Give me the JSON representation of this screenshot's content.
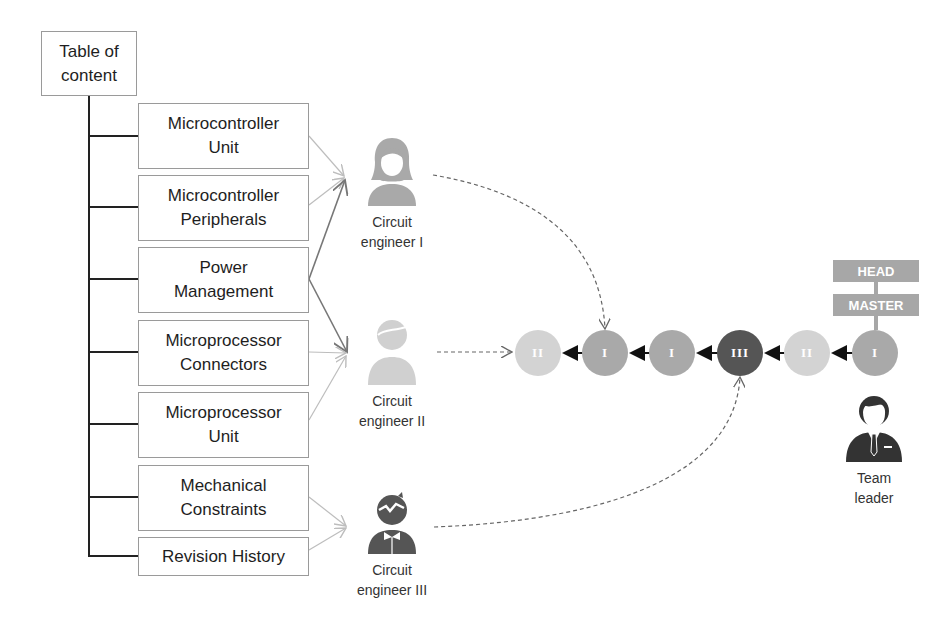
{
  "toc": {
    "root_label_line1": "Table of",
    "root_label_line2": "content",
    "sections": [
      {
        "line1": "Microcontroller",
        "line2": "Unit"
      },
      {
        "line1": "Microcontroller",
        "line2": "Peripherals"
      },
      {
        "line1": "Power",
        "line2": "Management"
      },
      {
        "line1": "Microprocessor",
        "line2": "Connectors"
      },
      {
        "line1": "Microprocessor",
        "line2": "Unit"
      },
      {
        "line1": "Mechanical",
        "line2": "Constraints"
      },
      {
        "line1": "Revision History",
        "line2": ""
      }
    ]
  },
  "people": [
    {
      "line1": "Circuit",
      "line2": "engineer I",
      "icon": "female-user-icon",
      "color": "#a9a9a9"
    },
    {
      "line1": "Circuit",
      "line2": "engineer II",
      "icon": "male-user-icon",
      "color": "#cfcfcf"
    },
    {
      "line1": "Circuit",
      "line2": "engineer III",
      "icon": "male-user-spiky-hair-icon",
      "color": "#555555"
    },
    {
      "line1": "Team",
      "line2": "leader",
      "icon": "businessman-icon",
      "color": "#333333"
    }
  ],
  "commits": [
    {
      "label": "II",
      "color": "#d3d3d3"
    },
    {
      "label": "I",
      "color": "#a9a9a9"
    },
    {
      "label": "I",
      "color": "#a9a9a9"
    },
    {
      "label": "III",
      "color": "#555555"
    },
    {
      "label": "II",
      "color": "#d3d3d3"
    },
    {
      "label": "I",
      "color": "#a9a9a9"
    }
  ],
  "refs": {
    "head": "HEAD",
    "master": "MASTER"
  }
}
